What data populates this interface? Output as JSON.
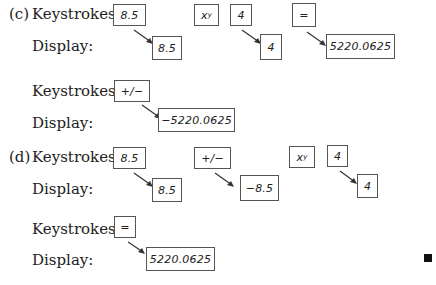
{
  "part_c": {
    "label": "(c)",
    "keystrokes_label": "Keystrokes:",
    "display_label": "Display:",
    "keys": [
      "8.5",
      "x",
      "4",
      "="
    ],
    "xy_superscript": "y",
    "displays": [
      "8.5",
      "4",
      "5220.0625"
    ],
    "second": {
      "keystrokes_label": "Keystrokes:",
      "display_label": "Display:",
      "key": "+/−",
      "display": "−5220.0625"
    }
  },
  "part_d": {
    "label": "(d)",
    "keystrokes_label": "Keystrokes:",
    "display_label": "Display:",
    "keys": [
      "8.5",
      "+/−",
      "x",
      "4"
    ],
    "xy_superscript": "y",
    "displays": [
      "8.5",
      "−8.5",
      "4"
    ],
    "second": {
      "keystrokes_label": "Keystrokes:",
      "display_label": "Display:",
      "key": "=",
      "display": "5220.0625"
    }
  },
  "end_mark": "end-of-proof-square"
}
